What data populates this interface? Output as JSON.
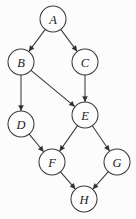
{
  "figure": {
    "background_color": "#fcfcfc",
    "stroke_color": "#3a3a3a",
    "label_color": "#1c1c1c",
    "node_fill": "#fdfdfd",
    "node_radius": 13,
    "width": 136,
    "height": 219
  },
  "chart_data": {
    "type": "diagram",
    "subtype": "directed-graph",
    "title": "",
    "directed": true,
    "node_labels": [
      "A",
      "B",
      "C",
      "D",
      "E",
      "F",
      "G",
      "H"
    ],
    "nodes": [
      {
        "id": "A",
        "label": "A",
        "x": 53,
        "y": 19
      },
      {
        "id": "B",
        "label": "B",
        "x": 21,
        "y": 62
      },
      {
        "id": "C",
        "label": "C",
        "x": 85,
        "y": 62
      },
      {
        "id": "D",
        "label": "D",
        "x": 21,
        "y": 124
      },
      {
        "id": "E",
        "label": "E",
        "x": 85,
        "y": 115
      },
      {
        "id": "F",
        "label": "F",
        "x": 52,
        "y": 162
      },
      {
        "id": "G",
        "label": "G",
        "x": 117,
        "y": 162
      },
      {
        "id": "H",
        "label": "H",
        "x": 84,
        "y": 199
      }
    ],
    "edges": [
      {
        "from": "A",
        "to": "B"
      },
      {
        "from": "A",
        "to": "C"
      },
      {
        "from": "B",
        "to": "D"
      },
      {
        "from": "B",
        "to": "E"
      },
      {
        "from": "C",
        "to": "E"
      },
      {
        "from": "D",
        "to": "F"
      },
      {
        "from": "E",
        "to": "F"
      },
      {
        "from": "E",
        "to": "G"
      },
      {
        "from": "F",
        "to": "H"
      },
      {
        "from": "G",
        "to": "H"
      }
    ],
    "edge_count": 10,
    "node_count": 8
  }
}
